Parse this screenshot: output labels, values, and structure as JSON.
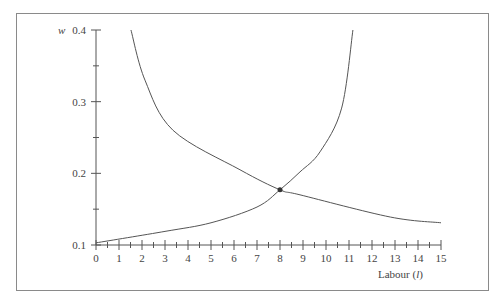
{
  "chart_data": {
    "type": "line",
    "title": "",
    "xlabel": "Labour (l)",
    "ylabel": "w",
    "xlim": [
      0,
      15
    ],
    "ylim": [
      0.1,
      0.4
    ],
    "x_ticks": [
      0,
      1,
      2,
      3,
      4,
      5,
      6,
      7,
      8,
      9,
      10,
      11,
      12,
      13,
      14,
      15
    ],
    "x_tick_labels": [
      "0",
      "1",
      "2",
      "3",
      "4",
      "5",
      "6",
      "7",
      "8",
      "9",
      "10",
      "11",
      "12",
      "13",
      "14",
      "15"
    ],
    "x_minor_ticks": true,
    "y_ticks": [
      0.1,
      0.2,
      0.3,
      0.4
    ],
    "y_tick_labels": [
      "0.1",
      "0.2",
      "0.3",
      "0.4"
    ],
    "y_minor_ticks": [
      0.15,
      0.25,
      0.35
    ],
    "grid": false,
    "legend": null,
    "series": [
      {
        "name": "decreasing curve",
        "x": [
          1.52,
          2.13,
          3.35,
          6.26,
          8.0,
          8.87,
          12.8,
          15.0
        ],
        "y": [
          0.4,
          0.33,
          0.26,
          0.205,
          0.177,
          0.17,
          0.139,
          0.131
        ]
      },
      {
        "name": "increasing curve",
        "x": [
          0,
          3,
          5,
          7,
          8.0,
          8.87,
          9.74,
          10.68,
          11.17
        ],
        "y": [
          0.103,
          0.119,
          0.131,
          0.153,
          0.177,
          0.202,
          0.23,
          0.291,
          0.4
        ]
      }
    ],
    "annotations": [
      {
        "type": "point",
        "label": "equilibrium",
        "x": 8.0,
        "y": 0.177
      }
    ]
  },
  "labels": {
    "y_axis": "w",
    "x_axis_main": "Labour (",
    "x_axis_var": "l",
    "x_axis_close": ")"
  },
  "style": {
    "line_color": "#555555",
    "axis_color": "#555555",
    "frame_color": "#8a8a8a",
    "point_color": "#333333"
  }
}
